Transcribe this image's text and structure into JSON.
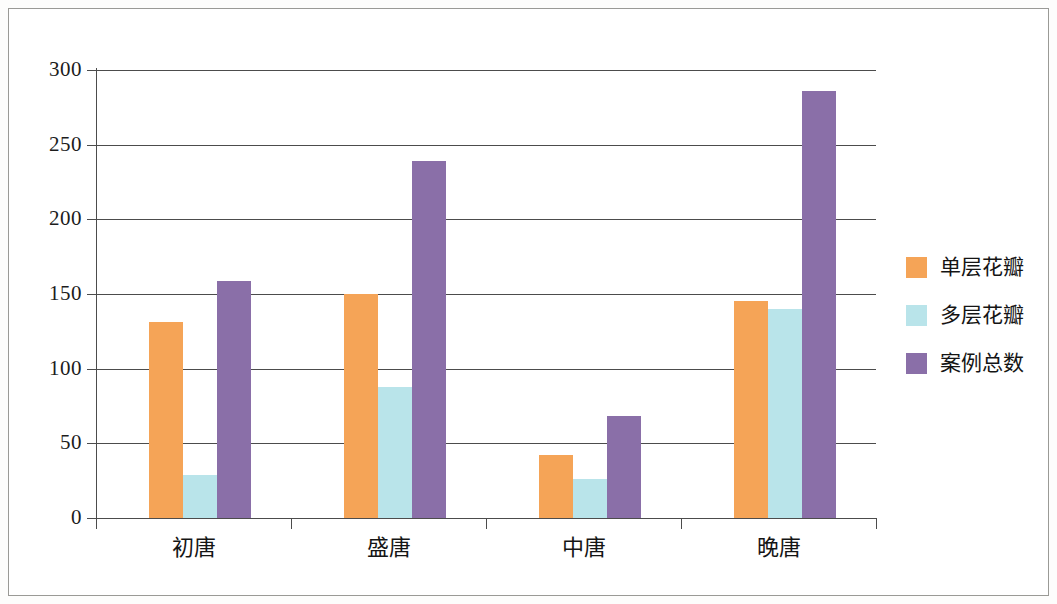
{
  "chart_data": {
    "type": "bar",
    "title": "",
    "subtitle": "",
    "xlabel": "",
    "ylabel": "",
    "categories": [
      "初唐",
      "盛唐",
      "中唐",
      "晚唐"
    ],
    "series": [
      {
        "name": "单层花瓣",
        "color": "#F5A457",
        "values": [
          131,
          150,
          42,
          145
        ]
      },
      {
        "name": "多层花瓣",
        "color": "#B9E4EA",
        "values": [
          29,
          88,
          26,
          140
        ]
      },
      {
        "name": "案例总数",
        "color": "#8A6FA8",
        "values": [
          159,
          239,
          68,
          286
        ]
      }
    ],
    "ylim": [
      0,
      300
    ],
    "yticks": [
      0,
      50,
      100,
      150,
      200,
      250,
      300
    ],
    "ytick_labels": [
      "0",
      "50",
      "100",
      "150",
      "200",
      "250",
      "300"
    ],
    "grid": true,
    "grid_axis": "y",
    "legend_position": "right",
    "annotations": []
  },
  "legend": {
    "items": [
      {
        "label": "单层花瓣",
        "color": "#F5A457"
      },
      {
        "label": "多层花瓣",
        "color": "#B9E4EA"
      },
      {
        "label": "案例总数",
        "color": "#8A6FA8"
      }
    ]
  }
}
